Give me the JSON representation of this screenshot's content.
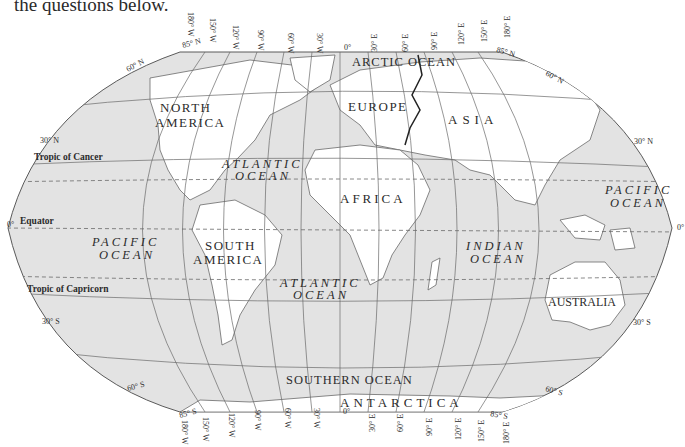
{
  "intro_text": "the questions below.",
  "map": {
    "projection": "Robinson-style world map",
    "continents": {
      "north_america": [
        "NORTH",
        "AMERICA"
      ],
      "south_america": [
        "SOUTH",
        "AMERICA"
      ],
      "europe": "EUROPE",
      "asia": "ASIA",
      "africa": "AFRICA",
      "australia": "AUSTRALIA",
      "antarctica": "ANTARCTICA"
    },
    "oceans": {
      "arctic": "ARCTIC OCEAN",
      "atlantic_north": [
        "ATLANTIC",
        "OCEAN"
      ],
      "atlantic_south": [
        "ATLANTIC",
        "OCEAN"
      ],
      "pacific_west": [
        "PACIFIC",
        "OCEAN"
      ],
      "pacific_east": [
        "PACIFIC",
        "OCEAN"
      ],
      "indian": [
        "INDIAN",
        "OCEAN"
      ],
      "southern": "SOUTHERN OCEAN"
    },
    "special_lines": {
      "tropic_of_cancer": "Tropic of Cancer",
      "equator": "Equator",
      "equator_deg": "0°",
      "tropic_of_capricorn": "Tropic of Capricorn"
    },
    "latitudes": {
      "n85_left": "85° N",
      "n85_right": "85° N",
      "n60_left": "60° N",
      "n60_right": "60° N",
      "n30_left": "30° N",
      "n30_right": "30° N",
      "eq_right": "0°",
      "s30_left": "30° S",
      "s30_right": "30° S",
      "s60_left": "60° S",
      "s60_right": "60° S",
      "s85_left": "85° S",
      "s85_right": "85° S"
    },
    "longitudes": [
      "180° W",
      "150° W",
      "120° W",
      "90° W",
      "60° W",
      "30° W",
      "0°",
      "30° E",
      "60° E",
      "90° E",
      "120° E",
      "150° E",
      "180° E"
    ],
    "colors": {
      "ocean": "#e3e3e3",
      "land": "#ffffff",
      "grid": "#6a6a6a",
      "border": "#2a2a2a",
      "text": "#2b2b2b"
    }
  }
}
